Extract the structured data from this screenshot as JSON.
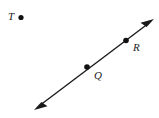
{
  "figure": {
    "type": "geometry-line-diagram",
    "canvas": {
      "width": 159,
      "height": 118
    },
    "colors": {
      "background": "#ffffff",
      "stroke": "#1a1a1a",
      "point_fill": "#111111",
      "label_text": "#1a1a1a"
    },
    "line": {
      "name": "line-QR",
      "double_arrow": true,
      "stroke_width": 1.4,
      "start": {
        "x": 34,
        "y": 110
      },
      "end": {
        "x": 154,
        "y": 19
      },
      "arrowhead_start": "arrow-lower-left",
      "arrowhead_end": "arrow-upper-right"
    },
    "points": [
      {
        "id": "T",
        "label": "T",
        "on_line": false,
        "dot": {
          "x": 21,
          "y": 17.5,
          "r": 2.6
        },
        "label_position": "left"
      },
      {
        "id": "Q",
        "label": "Q",
        "on_line": true,
        "dot": {
          "x": 87,
          "y": 67,
          "r": 2.8
        },
        "label_position": "below-right"
      },
      {
        "id": "R",
        "label": "R",
        "on_line": true,
        "dot": {
          "x": 126,
          "y": 40.5,
          "r": 2.8
        },
        "label_position": "below-right"
      }
    ]
  }
}
